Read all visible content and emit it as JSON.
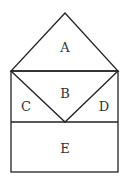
{
  "diagram": {
    "type": "geometric-figure",
    "regions": [
      {
        "id": "A",
        "label": "A",
        "shape": "triangle",
        "position": "top"
      },
      {
        "id": "B",
        "label": "B",
        "shape": "inverted-triangle",
        "position": "middle-center"
      },
      {
        "id": "C",
        "label": "C",
        "shape": "triangle",
        "position": "middle-left"
      },
      {
        "id": "D",
        "label": "D",
        "shape": "triangle",
        "position": "middle-right"
      },
      {
        "id": "E",
        "label": "E",
        "shape": "rectangle",
        "position": "bottom"
      }
    ],
    "stroke_color": "#222222",
    "background": "#ffffff"
  }
}
